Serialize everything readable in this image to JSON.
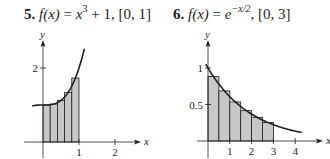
{
  "problems": [
    {
      "number": "5.",
      "func_lhs": "f(x)",
      "eq": " = ",
      "func_base": "x",
      "func_exp": "3",
      "func_tail": " + 1, ",
      "interval": "[0, 1]"
    },
    {
      "number": "6.",
      "func_lhs": "f(x)",
      "eq": " = ",
      "func_base": "e",
      "func_exp": "−x/2",
      "func_tail": ", ",
      "interval": "[0, 3]"
    }
  ],
  "chart_data": [
    {
      "type": "area",
      "title": "5. f(x) = x^3 + 1, [0, 1]",
      "xlabel": "x",
      "ylabel": "y",
      "x_ticks": [
        "1",
        "2"
      ],
      "y_ticks": [
        "2"
      ],
      "xlim": [
        -0.3,
        2.4
      ],
      "ylim": [
        0,
        2.9
      ],
      "grid": false,
      "curve": {
        "expr": "x^3 + 1",
        "x_range": [
          -0.3,
          1.15
        ]
      },
      "rectangles": {
        "method": "midpoint",
        "width": 0.2,
        "x_left": [
          0,
          0.2,
          0.4,
          0.6,
          0.8
        ],
        "heights": [
          1.001,
          1.027,
          1.125,
          1.343,
          1.729
        ]
      }
    },
    {
      "type": "area",
      "title": "6. f(x) = e^(-x/2), [0, 3]",
      "xlabel": "x",
      "ylabel": "y",
      "x_ticks": [
        "1",
        "2",
        "3",
        "4"
      ],
      "y_ticks": [
        "0.5",
        "1"
      ],
      "xlim": [
        -0.1,
        4.6
      ],
      "ylim": [
        0,
        1.3
      ],
      "grid": false,
      "curve": {
        "expr": "e^(-x/2)",
        "x_range": [
          -0.1,
          4.3
        ]
      },
      "rectangles": {
        "method": "midpoint",
        "width": 0.5,
        "x_left": [
          0,
          0.5,
          1,
          1.5,
          2,
          2.5
        ],
        "heights": [
          0.882,
          0.687,
          0.535,
          0.417,
          0.325,
          0.253
        ]
      }
    }
  ],
  "colors": {
    "bar_fill": "#c8c6c6",
    "line": "#231f20"
  }
}
